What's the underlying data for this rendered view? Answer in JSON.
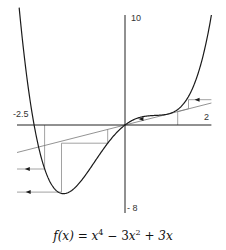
{
  "chart_data": {
    "type": "line",
    "function": "x^4 - 3x^2 + 3x",
    "xlabel": "",
    "ylabel": "",
    "xlim": [
      -2.5,
      2
    ],
    "ylim": [
      -8,
      10
    ],
    "x_tick_labels": [
      "-2.5",
      "2"
    ],
    "y_tick_labels": [
      "10",
      "-8"
    ],
    "grid": false,
    "legend": null,
    "series": [
      {
        "name": "f(x)",
        "kind": "curve",
        "x_range": [
          -2.45,
          2.0
        ]
      },
      {
        "name": "y = x",
        "kind": "line",
        "x_range": [
          -2.5,
          2.0
        ]
      }
    ],
    "iteration_paths": [
      {
        "name": "right-cobweb",
        "points": [
          [
            1.22,
            0
          ],
          [
            1.22,
            1.22
          ],
          [
            1.47,
            1.47
          ],
          [
            1.47,
            2.3
          ],
          [
            2.0,
            2.3
          ]
        ],
        "arrow": {
          "at": [
            1.68,
            2.3
          ],
          "direction": "left"
        }
      },
      {
        "name": "origin-cobweb",
        "arrow": {
          "at": [
            0.38,
            0.55
          ],
          "direction": "left"
        }
      },
      {
        "name": "left-cobweb-1",
        "points": [
          [
            -1.86,
            0
          ],
          [
            -1.86,
            -4.0
          ],
          [
            -2.5,
            -4.0
          ]
        ],
        "arrow": {
          "at": [
            -2.25,
            -4.0
          ],
          "direction": "left"
        }
      },
      {
        "name": "left-cobweb-2",
        "points": [
          [
            -0.4,
            -0.4
          ],
          [
            -0.4,
            -1.65
          ],
          [
            -1.47,
            -1.65
          ],
          [
            -1.47,
            -6.1
          ],
          [
            -2.5,
            -6.1
          ]
        ],
        "arrow": {
          "at": [
            -2.23,
            -6.1
          ],
          "direction": "left"
        }
      }
    ]
  },
  "labels": {
    "x_min": "-2.5",
    "x_max": "2",
    "y_max": "10",
    "y_min": "- 8"
  },
  "formula": {
    "lhs": "f(x)",
    "eq": "=",
    "t1_base": "x",
    "t1_exp": "4",
    "op1": "−",
    "t2_coef": "3",
    "t2_base": "x",
    "t2_exp": "2",
    "op2": "+",
    "t3": "3x"
  },
  "colors": {
    "curve": "#1a1a1a",
    "axis": "#222222",
    "line": "#777777",
    "cobweb": "#8a8a8a"
  }
}
